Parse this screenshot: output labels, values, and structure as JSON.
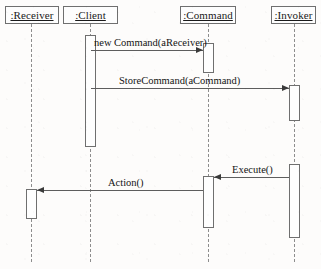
{
  "diagram": {
    "type": "uml-sequence-diagram",
    "width": 321,
    "height": 269,
    "background_color": "#fdfcfb",
    "line_color": "#6f6f6f",
    "text_color": "#141414"
  },
  "participants": [
    {
      "label": ":Receiver",
      "x": 5,
      "y": 6,
      "width": 54,
      "lifeline_x": 31
    },
    {
      "label": ":Client",
      "x": 63,
      "y": 6,
      "width": 55,
      "lifeline_x": 90
    },
    {
      "label": ":Command",
      "x": 180,
      "y": 6,
      "width": 56,
      "lifeline_x": 208
    },
    {
      "label": ":Invoker",
      "x": 271,
      "y": 6,
      "width": 45,
      "lifeline_x": 294
    }
  ],
  "lifelines": [
    {
      "participant": ":Receiver",
      "x": 31,
      "top": 24,
      "bottom": 262
    },
    {
      "participant": ":Client",
      "x": 90,
      "top": 24,
      "bottom": 262
    },
    {
      "participant": ":Command",
      "x": 208,
      "top": 24,
      "bottom": 262
    },
    {
      "participant": ":Invoker",
      "x": 294,
      "top": 24,
      "bottom": 262
    }
  ],
  "activations": [
    {
      "name": "client-activation",
      "participant": ":Client",
      "x": 85,
      "top": 35,
      "height": 112
    },
    {
      "name": "command-activation-1",
      "participant": ":Command",
      "x": 203,
      "top": 43,
      "height": 30
    },
    {
      "name": "invoker-activation-1",
      "participant": ":Invoker",
      "x": 289,
      "top": 85,
      "height": 36
    },
    {
      "name": "invoker-activation-2",
      "participant": ":Invoker",
      "x": 289,
      "top": 164,
      "height": 74
    },
    {
      "name": "command-activation-2",
      "participant": ":Command",
      "x": 203,
      "top": 176,
      "height": 52
    },
    {
      "name": "receiver-activation",
      "participant": ":Receiver",
      "x": 26,
      "top": 189,
      "height": 30
    }
  ],
  "messages": [
    {
      "label": "new Command(aReceiver)",
      "from": ":Client",
      "to": ":Command",
      "direction": "right",
      "y": 50,
      "x_start": 91,
      "x_end": 203,
      "label_x": 94,
      "label_y": 38
    },
    {
      "label": "StoreCommand(aCommand)",
      "from": ":Client",
      "to": ":Invoker",
      "direction": "right",
      "y": 88,
      "x_start": 91,
      "x_end": 289,
      "label_x": 119,
      "label_y": 76
    },
    {
      "label": "Execute()",
      "from": ":Invoker",
      "to": ":Command",
      "direction": "left",
      "y": 177,
      "x_start": 214,
      "x_end": 289,
      "label_x": 232,
      "label_y": 165
    },
    {
      "label": "Action()",
      "from": ":Command",
      "to": ":Receiver",
      "direction": "left",
      "y": 190,
      "x_start": 37,
      "x_end": 203,
      "label_x": 108,
      "label_y": 178
    }
  ]
}
